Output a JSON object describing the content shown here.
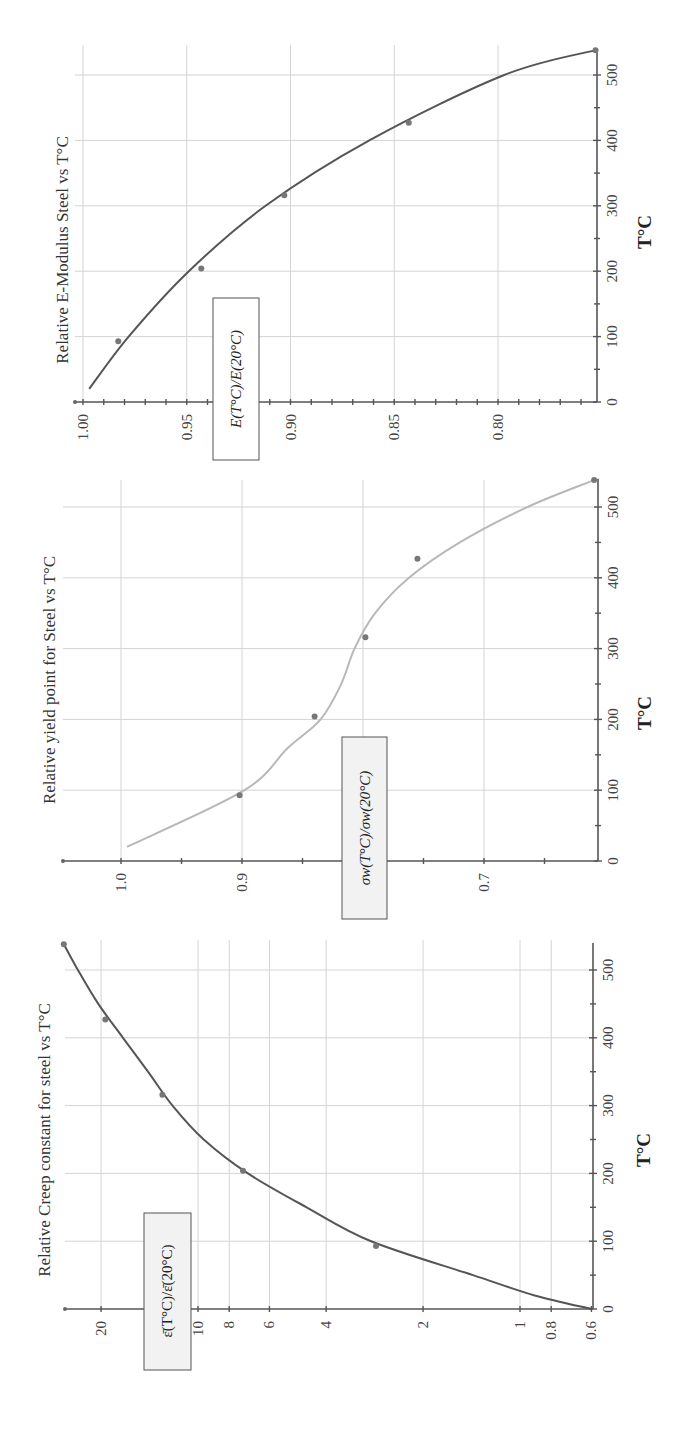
{
  "chart_data": [
    {
      "type": "line",
      "title": "Relative E-Modulus Steel vs T°C",
      "xlabel": "T°C",
      "ylabel": "E(T°C)/E(20°C)",
      "xlim": [
        0,
        540
      ],
      "ylim": [
        0.75,
        1.0
      ],
      "x_ticks": [
        0,
        100,
        200,
        300,
        400,
        500
      ],
      "y_ticks": [
        "1.00",
        "0.95",
        "0.90",
        "0.85",
        "0.80"
      ],
      "grid": true,
      "series": [
        {
          "name": "points",
          "x": [
            93,
            204,
            316,
            427,
            538
          ],
          "y": [
            0.983,
            0.943,
            0.903,
            0.843,
            0.753
          ]
        },
        {
          "name": "fit",
          "x": [
            20,
            100,
            200,
            300,
            400,
            500,
            538
          ],
          "y": [
            0.997,
            0.978,
            0.949,
            0.912,
            0.862,
            0.797,
            0.753
          ]
        }
      ],
      "curve_color": "#555555"
    },
    {
      "type": "line",
      "title": "Relative yield point for Steel vs T°C",
      "xlabel": "T°C",
      "ylabel": "σw(T°C)/σw(20°C)",
      "xlim": [
        0,
        540
      ],
      "ylim": [
        0.6,
        1.0
      ],
      "x_ticks": [
        0,
        100,
        200,
        300,
        400,
        500
      ],
      "y_ticks": [
        "1.0",
        "0.9",
        "0.7"
      ],
      "grid": true,
      "series": [
        {
          "name": "points",
          "x": [
            93,
            204,
            316,
            427,
            538
          ],
          "y": [
            0.902,
            0.84,
            0.798,
            0.755,
            0.609
          ]
        },
        {
          "name": "fit",
          "x": [
            20,
            100,
            160,
            200,
            250,
            300,
            350,
            400,
            450,
            500,
            538
          ],
          "y": [
            0.995,
            0.898,
            0.862,
            0.835,
            0.818,
            0.807,
            0.79,
            0.762,
            0.72,
            0.664,
            0.609
          ]
        }
      ],
      "curve_color": "#b8b8b8"
    },
    {
      "type": "line",
      "title": "Relative Creep constant for steel vs T°C",
      "xlabel": "T°C",
      "ylabel": "ε̄(T°C)/ε̄(20°C)",
      "yscale": "log",
      "xlim": [
        0,
        540
      ],
      "ylim": [
        0.6,
        26
      ],
      "x_ticks": [
        0,
        100,
        200,
        300,
        400,
        500
      ],
      "y_ticks": [
        "20",
        "10",
        "8",
        "6",
        "4",
        "2",
        "1",
        "0.8",
        "0.6"
      ],
      "grid": true,
      "series": [
        {
          "name": "points",
          "x": [
            93,
            204,
            316,
            427,
            538
          ],
          "y": [
            2.8,
            7.25,
            12.9,
            19.4,
            26.1
          ]
        },
        {
          "name": "fit",
          "x": [
            0,
            20,
            50,
            100,
            150,
            200,
            250,
            300,
            350,
            400,
            450,
            500,
            538
          ],
          "y": [
            0.6,
            0.9,
            1.4,
            2.9,
            4.6,
            7.0,
            9.6,
            12.0,
            14.3,
            17.1,
            20.4,
            23.6,
            26.1
          ]
        }
      ],
      "curve_color": "#555555"
    }
  ],
  "charts": {
    "e_modulus": {
      "title": "Relative E-Modulus Steel vs T°C",
      "xlabel": "T°C",
      "ylabel": "E(T°C)/E(20°C)"
    },
    "yield": {
      "title": "Relative yield point for Steel vs T°C",
      "xlabel": "T°C",
      "ylabel": "σw(T°C)/σw(20°C)"
    },
    "creep": {
      "title": "Relative Creep constant for steel vs T°C",
      "xlabel": "T°C",
      "ylabel": "ε̄(T°C)/ε̄(20°C)"
    }
  }
}
